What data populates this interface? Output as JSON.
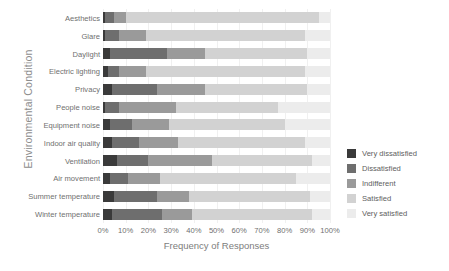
{
  "chart_data": {
    "type": "bar",
    "orientation": "horizontal",
    "stacked": true,
    "title": "",
    "xlabel": "Frequency of Responses",
    "ylabel": "Environmental Condition",
    "xlim": [
      0,
      100
    ],
    "xticks": [
      "0%",
      "10%",
      "20%",
      "30%",
      "40%",
      "50%",
      "60%",
      "70%",
      "80%",
      "90%",
      "100%"
    ],
    "xtick_values": [
      0,
      10,
      20,
      30,
      40,
      50,
      60,
      70,
      80,
      90,
      100
    ],
    "grid": true,
    "legend_position": "right",
    "categories": [
      "Aesthetics",
      "Glare",
      "Daylight",
      "Electric lighting",
      "Privacy",
      "People noise",
      "Equipment noise",
      "Indoor air quality",
      "Ventilation",
      "Air movement",
      "Summer temperature",
      "Winter temperature"
    ],
    "series": [
      {
        "name": "Very dissatisfied",
        "color": "#3a3a3a",
        "values": [
          1,
          1,
          3,
          2,
          4,
          1,
          3,
          4,
          6,
          3,
          5,
          4
        ]
      },
      {
        "name": "Dissatisfied",
        "color": "#6e6e6e",
        "values": [
          4,
          6,
          25,
          5,
          20,
          6,
          10,
          12,
          14,
          8,
          19,
          22
        ]
      },
      {
        "name": "Indifferent",
        "color": "#9a9a9a",
        "values": [
          5,
          12,
          17,
          12,
          21,
          25,
          16,
          17,
          28,
          14,
          14,
          13
        ]
      },
      {
        "name": "Satisfied",
        "color": "#d2d2d2",
        "values": [
          85,
          70,
          45,
          70,
          45,
          45,
          51,
          56,
          44,
          60,
          53,
          53
        ]
      },
      {
        "name": "Very satisfied",
        "color": "#ececec",
        "values": [
          5,
          11,
          10,
          11,
          10,
          23,
          20,
          11,
          8,
          15,
          9,
          8
        ]
      }
    ]
  },
  "legend": {
    "items": [
      {
        "label": "Very dissatisfied",
        "color": "#3a3a3a"
      },
      {
        "label": "Dissatisfied",
        "color": "#6e6e6e"
      },
      {
        "label": "Indifferent",
        "color": "#9a9a9a"
      },
      {
        "label": "Satisfied",
        "color": "#d2d2d2"
      },
      {
        "label": "Very satisfied",
        "color": "#ececec"
      }
    ]
  }
}
